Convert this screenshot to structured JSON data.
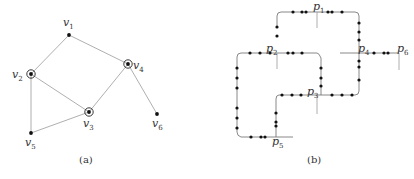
{
  "figure_a": {
    "caption": "(a)",
    "nodes": [
      {
        "id": "v1",
        "base": "v",
        "sub": "1",
        "x": 69,
        "y": 35,
        "ring": false,
        "lx": 63,
        "ly": 26
      },
      {
        "id": "v2",
        "base": "v",
        "sub": "2",
        "x": 31,
        "y": 74,
        "ring": true,
        "lx": 12,
        "ly": 78
      },
      {
        "id": "v3",
        "base": "v",
        "sub": "3",
        "x": 89,
        "y": 112,
        "ring": true,
        "lx": 83,
        "ly": 127
      },
      {
        "id": "v4",
        "base": "v",
        "sub": "4",
        "x": 128,
        "y": 64,
        "ring": true,
        "lx": 133,
        "ly": 69
      },
      {
        "id": "v5",
        "base": "v",
        "sub": "5",
        "x": 31,
        "y": 133,
        "ring": false,
        "lx": 25,
        "ly": 146
      },
      {
        "id": "v6",
        "base": "v",
        "sub": "6",
        "x": 157,
        "y": 114,
        "ring": false,
        "lx": 152,
        "ly": 127
      }
    ],
    "edges": [
      [
        "v1",
        "v2"
      ],
      [
        "v1",
        "v4"
      ],
      [
        "v2",
        "v3"
      ],
      [
        "v2",
        "v5"
      ],
      [
        "v3",
        "v4"
      ],
      [
        "v3",
        "v5"
      ],
      [
        "v4",
        "v6"
      ]
    ]
  },
  "figure_b": {
    "caption": "(b)",
    "labels": [
      {
        "base": "p",
        "sub": "1",
        "x": 313,
        "y": 10
      },
      {
        "base": "p",
        "sub": "2",
        "x": 266,
        "y": 52
      },
      {
        "base": "p",
        "sub": "3",
        "x": 307,
        "y": 95
      },
      {
        "base": "p",
        "sub": "4",
        "x": 358,
        "y": 52
      },
      {
        "base": "p",
        "sub": "5",
        "x": 272,
        "y": 145
      },
      {
        "base": "p",
        "sub": "6",
        "x": 397,
        "y": 52
      }
    ]
  }
}
